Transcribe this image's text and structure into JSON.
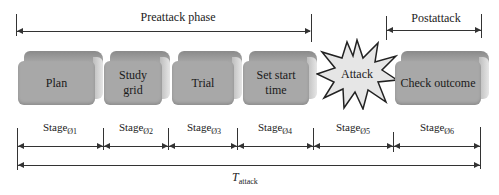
{
  "phases": {
    "preattack": "Preattack phase",
    "postattack": "Postattack"
  },
  "steps": [
    {
      "id": "plan",
      "label": "Plan"
    },
    {
      "id": "study-grid",
      "label": "Study grid"
    },
    {
      "id": "trial",
      "label": "Trial"
    },
    {
      "id": "set-start-time",
      "label": "Set start time"
    },
    {
      "id": "attack",
      "label": "Attack",
      "shape": "starburst"
    },
    {
      "id": "check-outcome",
      "label": "Check outcome"
    }
  ],
  "stages": [
    {
      "base": "Stage",
      "sub": "Ø1"
    },
    {
      "base": "Stage",
      "sub": "Ø2"
    },
    {
      "base": "Stage",
      "sub": "Ø3"
    },
    {
      "base": "Stage",
      "sub": "Ø4"
    },
    {
      "base": "Stage",
      "sub": "Ø5"
    },
    {
      "base": "Stage",
      "sub": "Ø6"
    }
  ],
  "total": {
    "base": "T",
    "sub": "attack"
  },
  "colors": {
    "box_face": "#a8a8a8",
    "box_top": "#8a8a8a",
    "star_fill": "#e6e6e6",
    "line": "#333333"
  }
}
